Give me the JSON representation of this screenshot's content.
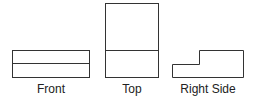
{
  "diagram": {
    "type": "orthographic-projection",
    "views": [
      {
        "name": "Front",
        "label": "Front"
      },
      {
        "name": "Top",
        "label": "Top"
      },
      {
        "name": "Right Side",
        "label": "Right Side"
      }
    ],
    "stroke_color": "#333333",
    "background": "#ffffff"
  }
}
